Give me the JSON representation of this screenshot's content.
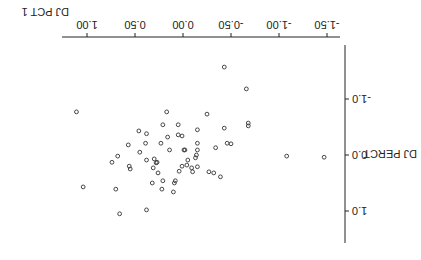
{
  "chart_data": {
    "type": "scatter",
    "orientation_note": "rendered rotated 180 degrees",
    "title": "",
    "xlabel": "DJ PCT 1",
    "ylabel": "DJ PERCT",
    "xlim": [
      -1.6,
      1.27
    ],
    "ylim": [
      -1.96,
      1.6
    ],
    "x_ticks": [
      -1.5,
      -1.0,
      -0.5,
      0.0,
      0.5,
      1.0
    ],
    "x_tick_labels": [
      "-1.50",
      "-1.00",
      "-0.50",
      "0.00",
      "0.50",
      "1.00"
    ],
    "y_ticks": [
      -1.0,
      0.0,
      1.0
    ],
    "y_tick_labels": [
      "-1.0",
      "0.0",
      "1.0"
    ],
    "grid": false,
    "marker": "open-circle",
    "points": [
      {
        "x": 1.11,
        "y": -0.77
      },
      {
        "x": 0.46,
        "y": -0.43
      },
      {
        "x": 0.57,
        "y": -0.18
      },
      {
        "x": 0.68,
        "y": 0.02
      },
      {
        "x": 0.74,
        "y": 0.13
      },
      {
        "x": 0.56,
        "y": 0.2
      },
      {
        "x": 0.55,
        "y": 0.25
      },
      {
        "x": 1.04,
        "y": 0.57
      },
      {
        "x": 0.7,
        "y": 0.61
      },
      {
        "x": 0.66,
        "y": 1.05
      },
      {
        "x": 0.17,
        "y": -0.77
      },
      {
        "x": 0.21,
        "y": -0.54
      },
      {
        "x": 0.38,
        "y": -0.38
      },
      {
        "x": 0.05,
        "y": -0.54
      },
      {
        "x": 0.16,
        "y": -0.32
      },
      {
        "x": 0.05,
        "y": -0.36
      },
      {
        "x": 0.01,
        "y": -0.34
      },
      {
        "x": 0.39,
        "y": -0.21
      },
      {
        "x": 0.23,
        "y": -0.21
      },
      {
        "x": 0.14,
        "y": -0.09
      },
      {
        "x": 0.45,
        "y": -0.05
      },
      {
        "x": -0.02,
        "y": -0.09
      },
      {
        "x": 0.38,
        "y": 0.09
      },
      {
        "x": 0.3,
        "y": 0.07
      },
      {
        "x": 0.28,
        "y": 0.14
      },
      {
        "x": 0.27,
        "y": 0.13
      },
      {
        "x": 0.31,
        "y": 0.23
      },
      {
        "x": -0.04,
        "y": 0.18
      },
      {
        "x": 0.26,
        "y": 0.32
      },
      {
        "x": 0.04,
        "y": 0.29
      },
      {
        "x": -0.09,
        "y": 0.23
      },
      {
        "x": 0.32,
        "y": 0.5
      },
      {
        "x": 0.21,
        "y": 0.46
      },
      {
        "x": 0.09,
        "y": 0.5
      },
      {
        "x": 0.08,
        "y": 0.46
      },
      {
        "x": 0.1,
        "y": 0.66
      },
      {
        "x": 0.22,
        "y": 0.61
      },
      {
        "x": 0.38,
        "y": 0.98
      },
      {
        "x": -0.43,
        "y": -1.57
      },
      {
        "x": -0.66,
        "y": -1.18
      },
      {
        "x": -0.25,
        "y": -0.73
      },
      {
        "x": -0.68,
        "y": -0.57
      },
      {
        "x": -0.68,
        "y": -0.52
      },
      {
        "x": -0.43,
        "y": -0.48
      },
      {
        "x": -0.15,
        "y": -0.45
      },
      {
        "x": -0.15,
        "y": -0.21
      },
      {
        "x": -0.46,
        "y": -0.21
      },
      {
        "x": -0.5,
        "y": -0.2
      },
      {
        "x": -0.34,
        "y": -0.13
      },
      {
        "x": -0.01,
        "y": -0.09
      },
      {
        "x": -0.15,
        "y": -0.09
      },
      {
        "x": -0.14,
        "y": 0.0
      },
      {
        "x": -0.13,
        "y": 0.05
      },
      {
        "x": -0.05,
        "y": 0.09
      },
      {
        "x": 0.01,
        "y": 0.2
      },
      {
        "x": -0.15,
        "y": 0.21
      },
      {
        "x": -0.1,
        "y": 0.3
      },
      {
        "x": -0.27,
        "y": 0.3
      },
      {
        "x": -0.32,
        "y": 0.32
      },
      {
        "x": -0.39,
        "y": 0.39
      },
      {
        "x": -1.08,
        "y": 0.02
      },
      {
        "x": -1.47,
        "y": 0.04
      }
    ]
  },
  "axes": {
    "x_label": "DJ PCT 1",
    "y_label": "DJ PERCT"
  }
}
